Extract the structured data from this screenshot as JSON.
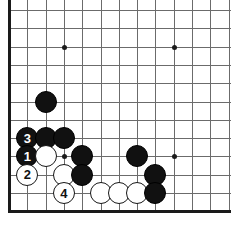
{
  "board": {
    "title": "Go board diagram",
    "type": "go-board-diagram",
    "size_label": "partial 19x19 board, bottom-left corner",
    "grid": {
      "origin_x": 9,
      "origin_y": 10,
      "spacing": 18.3,
      "cols": 13,
      "rows": 12,
      "line_color": "#6b6b6b",
      "edge_color": "#1a1a1a",
      "background": "#ffffff"
    },
    "star_points": [
      {
        "col": 3,
        "row": 2
      },
      {
        "col": 9,
        "row": 2
      },
      {
        "col": 3,
        "row": 8
      },
      {
        "col": 9,
        "row": 8
      }
    ],
    "stones": [
      {
        "color": "black",
        "col": 2,
        "row": 5,
        "label": ""
      },
      {
        "color": "black",
        "col": 1,
        "row": 7,
        "label": "3"
      },
      {
        "color": "black",
        "col": 2,
        "row": 7,
        "label": ""
      },
      {
        "color": "black",
        "col": 3,
        "row": 7,
        "label": ""
      },
      {
        "color": "black",
        "col": 1,
        "row": 8,
        "label": "1"
      },
      {
        "color": "white",
        "col": 2,
        "row": 8,
        "label": ""
      },
      {
        "color": "black",
        "col": 4,
        "row": 8,
        "label": ""
      },
      {
        "color": "black",
        "col": 7,
        "row": 8,
        "label": ""
      },
      {
        "color": "white",
        "col": 1,
        "row": 9,
        "label": "2"
      },
      {
        "color": "white",
        "col": 3,
        "row": 9,
        "label": ""
      },
      {
        "color": "black",
        "col": 4,
        "row": 9,
        "label": ""
      },
      {
        "color": "black",
        "col": 8,
        "row": 9,
        "label": ""
      },
      {
        "color": "white",
        "col": 3,
        "row": 10,
        "label": "4"
      },
      {
        "color": "white",
        "col": 5,
        "row": 10,
        "label": ""
      },
      {
        "color": "white",
        "col": 6,
        "row": 10,
        "label": ""
      },
      {
        "color": "white",
        "col": 7,
        "row": 10,
        "label": ""
      },
      {
        "color": "black",
        "col": 8,
        "row": 10,
        "label": ""
      }
    ],
    "move_numbers": [
      {
        "number": "1",
        "color": "black"
      },
      {
        "number": "2",
        "color": "white"
      },
      {
        "number": "3",
        "color": "black"
      },
      {
        "number": "4",
        "color": "white"
      }
    ]
  }
}
